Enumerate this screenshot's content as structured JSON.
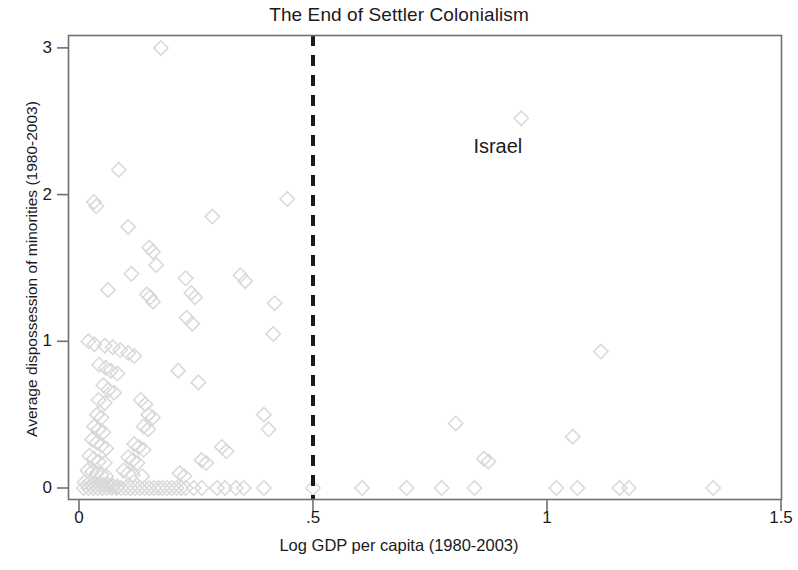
{
  "chart_data": {
    "type": "scatter",
    "title": "The End of Settler Colonialism",
    "xlabel": "Log GDP per capita (1980-2003)",
    "ylabel": "Average dispossession of minorities (1980-2003)",
    "xlim": [
      0,
      1.5
    ],
    "ylim": [
      0,
      3.08
    ],
    "xticks": [
      0,
      0.5,
      1,
      1.5
    ],
    "xtick_labels": [
      "0",
      ".5",
      "1",
      "1.5"
    ],
    "yticks": [
      0,
      1,
      2,
      3
    ],
    "ytick_labels": [
      "0",
      "1",
      "2",
      "3"
    ],
    "grid": false,
    "legend": "none",
    "marker": "hollow-diamond",
    "marker_color": "#d8d8d8",
    "reference_lines": [
      {
        "orientation": "vertical",
        "value": 0.5,
        "style": "dashed",
        "color": "#1a1a1a",
        "width": 4
      }
    ],
    "annotations": [
      {
        "text": "Israel",
        "x": 0.895,
        "y": 2.33,
        "points_to": {
          "x": 0.945,
          "y": 2.52
        }
      }
    ],
    "points": [
      {
        "x": 0.175,
        "y": 3.0
      },
      {
        "x": 0.085,
        "y": 2.17
      },
      {
        "x": 0.945,
        "y": 2.52
      },
      {
        "x": 0.032,
        "y": 1.95
      },
      {
        "x": 0.037,
        "y": 1.92
      },
      {
        "x": 0.445,
        "y": 1.97
      },
      {
        "x": 0.105,
        "y": 1.78
      },
      {
        "x": 0.285,
        "y": 1.85
      },
      {
        "x": 0.15,
        "y": 1.64
      },
      {
        "x": 0.158,
        "y": 1.61
      },
      {
        "x": 0.112,
        "y": 1.46
      },
      {
        "x": 0.165,
        "y": 1.52
      },
      {
        "x": 0.228,
        "y": 1.43
      },
      {
        "x": 0.345,
        "y": 1.45
      },
      {
        "x": 0.355,
        "y": 1.41
      },
      {
        "x": 0.062,
        "y": 1.35
      },
      {
        "x": 0.145,
        "y": 1.32
      },
      {
        "x": 0.152,
        "y": 1.3
      },
      {
        "x": 0.158,
        "y": 1.27
      },
      {
        "x": 0.24,
        "y": 1.33
      },
      {
        "x": 0.248,
        "y": 1.3
      },
      {
        "x": 0.418,
        "y": 1.26
      },
      {
        "x": 0.23,
        "y": 1.16
      },
      {
        "x": 0.242,
        "y": 1.12
      },
      {
        "x": 0.415,
        "y": 1.05
      },
      {
        "x": 0.02,
        "y": 1.0
      },
      {
        "x": 0.033,
        "y": 0.98
      },
      {
        "x": 0.055,
        "y": 0.97
      },
      {
        "x": 0.072,
        "y": 0.96
      },
      {
        "x": 0.088,
        "y": 0.94
      },
      {
        "x": 0.105,
        "y": 0.92
      },
      {
        "x": 0.118,
        "y": 0.9
      },
      {
        "x": 1.115,
        "y": 0.93
      },
      {
        "x": 0.043,
        "y": 0.84
      },
      {
        "x": 0.057,
        "y": 0.82
      },
      {
        "x": 0.068,
        "y": 0.8
      },
      {
        "x": 0.082,
        "y": 0.78
      },
      {
        "x": 0.212,
        "y": 0.8
      },
      {
        "x": 0.255,
        "y": 0.72
      },
      {
        "x": 0.052,
        "y": 0.7
      },
      {
        "x": 0.063,
        "y": 0.67
      },
      {
        "x": 0.075,
        "y": 0.65
      },
      {
        "x": 0.042,
        "y": 0.6
      },
      {
        "x": 0.055,
        "y": 0.58
      },
      {
        "x": 0.132,
        "y": 0.6
      },
      {
        "x": 0.142,
        "y": 0.57
      },
      {
        "x": 0.038,
        "y": 0.5
      },
      {
        "x": 0.048,
        "y": 0.48
      },
      {
        "x": 0.148,
        "y": 0.5
      },
      {
        "x": 0.158,
        "y": 0.48
      },
      {
        "x": 0.395,
        "y": 0.5
      },
      {
        "x": 0.032,
        "y": 0.42
      },
      {
        "x": 0.042,
        "y": 0.4
      },
      {
        "x": 0.052,
        "y": 0.38
      },
      {
        "x": 0.138,
        "y": 0.42
      },
      {
        "x": 0.148,
        "y": 0.4
      },
      {
        "x": 0.405,
        "y": 0.4
      },
      {
        "x": 0.805,
        "y": 0.44
      },
      {
        "x": 0.028,
        "y": 0.33
      },
      {
        "x": 0.038,
        "y": 0.31
      },
      {
        "x": 0.048,
        "y": 0.29
      },
      {
        "x": 0.058,
        "y": 0.27
      },
      {
        "x": 0.118,
        "y": 0.3
      },
      {
        "x": 0.128,
        "y": 0.28
      },
      {
        "x": 0.138,
        "y": 0.26
      },
      {
        "x": 0.305,
        "y": 0.28
      },
      {
        "x": 0.315,
        "y": 0.25
      },
      {
        "x": 1.055,
        "y": 0.35
      },
      {
        "x": 0.022,
        "y": 0.22
      },
      {
        "x": 0.032,
        "y": 0.2
      },
      {
        "x": 0.042,
        "y": 0.18
      },
      {
        "x": 0.055,
        "y": 0.17
      },
      {
        "x": 0.105,
        "y": 0.21
      },
      {
        "x": 0.115,
        "y": 0.19
      },
      {
        "x": 0.125,
        "y": 0.17
      },
      {
        "x": 0.262,
        "y": 0.19
      },
      {
        "x": 0.272,
        "y": 0.17
      },
      {
        "x": 0.865,
        "y": 0.2
      },
      {
        "x": 0.875,
        "y": 0.18
      },
      {
        "x": 0.018,
        "y": 0.12
      },
      {
        "x": 0.028,
        "y": 0.11
      },
      {
        "x": 0.038,
        "y": 0.1
      },
      {
        "x": 0.048,
        "y": 0.09
      },
      {
        "x": 0.058,
        "y": 0.08
      },
      {
        "x": 0.095,
        "y": 0.12
      },
      {
        "x": 0.105,
        "y": 0.1
      },
      {
        "x": 0.115,
        "y": 0.09
      },
      {
        "x": 0.135,
        "y": 0.08
      },
      {
        "x": 0.215,
        "y": 0.1
      },
      {
        "x": 0.225,
        "y": 0.08
      },
      {
        "x": 0.012,
        "y": 0.04
      },
      {
        "x": 0.022,
        "y": 0.035
      },
      {
        "x": 0.032,
        "y": 0.03
      },
      {
        "x": 0.042,
        "y": 0.025
      },
      {
        "x": 0.052,
        "y": 0.02
      },
      {
        "x": 0.062,
        "y": 0.02
      },
      {
        "x": 0.072,
        "y": 0.015
      },
      {
        "x": 0.082,
        "y": 0.01
      },
      {
        "x": 0.01,
        "y": 0.0
      },
      {
        "x": 0.02,
        "y": 0.0
      },
      {
        "x": 0.03,
        "y": 0.0
      },
      {
        "x": 0.04,
        "y": 0.0
      },
      {
        "x": 0.05,
        "y": 0.0
      },
      {
        "x": 0.06,
        "y": 0.0
      },
      {
        "x": 0.07,
        "y": 0.0
      },
      {
        "x": 0.08,
        "y": 0.0
      },
      {
        "x": 0.09,
        "y": 0.0
      },
      {
        "x": 0.1,
        "y": 0.0
      },
      {
        "x": 0.11,
        "y": 0.0
      },
      {
        "x": 0.12,
        "y": 0.0
      },
      {
        "x": 0.13,
        "y": 0.0
      },
      {
        "x": 0.14,
        "y": 0.0
      },
      {
        "x": 0.15,
        "y": 0.0
      },
      {
        "x": 0.16,
        "y": 0.0
      },
      {
        "x": 0.17,
        "y": 0.0
      },
      {
        "x": 0.178,
        "y": 0.0
      },
      {
        "x": 0.188,
        "y": 0.0
      },
      {
        "x": 0.198,
        "y": 0.0
      },
      {
        "x": 0.208,
        "y": 0.0
      },
      {
        "x": 0.218,
        "y": 0.0
      },
      {
        "x": 0.228,
        "y": 0.0
      },
      {
        "x": 0.245,
        "y": 0.0
      },
      {
        "x": 0.262,
        "y": 0.0
      },
      {
        "x": 0.295,
        "y": 0.0
      },
      {
        "x": 0.312,
        "y": 0.0
      },
      {
        "x": 0.335,
        "y": 0.0
      },
      {
        "x": 0.352,
        "y": 0.0
      },
      {
        "x": 0.395,
        "y": 0.0
      },
      {
        "x": 0.5,
        "y": 0.0
      },
      {
        "x": 0.605,
        "y": 0.0
      },
      {
        "x": 0.7,
        "y": 0.0
      },
      {
        "x": 0.775,
        "y": 0.0
      },
      {
        "x": 0.845,
        "y": 0.0
      },
      {
        "x": 1.02,
        "y": 0.0
      },
      {
        "x": 1.065,
        "y": 0.0
      },
      {
        "x": 1.155,
        "y": 0.0
      },
      {
        "x": 1.175,
        "y": 0.0
      },
      {
        "x": 1.355,
        "y": 0.0
      }
    ]
  }
}
